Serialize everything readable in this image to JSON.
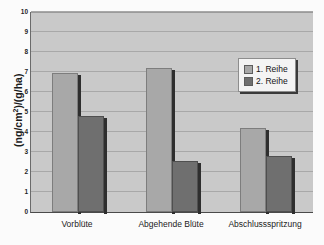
{
  "chart_data": {
    "type": "bar",
    "title": "",
    "subtitle": "",
    "xlabel": "",
    "ylabel": "(ng/cm²)/(g/ha)",
    "ylabel_parts": {
      "prefix": "(ng/cm",
      "superscript": "2",
      "suffix": ")/(g/ha)"
    },
    "categories": [
      "Vorblüte",
      "Abgehende Blüte",
      "Abschlussspritzung"
    ],
    "series": [
      {
        "name": "1. Reihe",
        "values": [
          6.95,
          7.22,
          4.2
        ],
        "color": "#a8a8a8"
      },
      {
        "name": "2. Reihe",
        "values": [
          4.8,
          2.55,
          2.8
        ],
        "color": "#6f6f6f"
      }
    ],
    "ylim": [
      0,
      10
    ],
    "ytick_values": [
      0,
      1,
      2,
      3,
      4,
      5,
      6,
      7,
      8,
      9,
      10
    ],
    "ytick_labels": [
      "0",
      "1",
      "2",
      "3",
      "4",
      "5",
      "6",
      "7",
      "8",
      "9",
      "10"
    ],
    "grid": true,
    "grid_axis": "y",
    "legend": {
      "position": "upper right",
      "entries": [
        "1. Reihe",
        "2. Reihe"
      ]
    },
    "plot_background": "#c9c9c9",
    "figure_background": "#ffffff"
  }
}
